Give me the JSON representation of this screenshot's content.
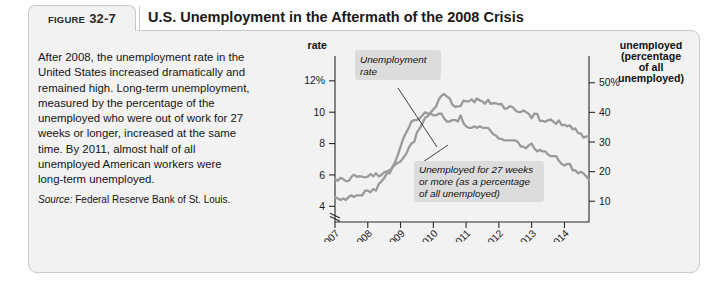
{
  "header": {
    "figure_word": "FIGURE",
    "figure_number": "32-7",
    "title": "U.S. Unemployment in the Aftermath of the 2008 Crisis"
  },
  "caption": {
    "body": "After 2008, the unemployment rate in the United States increased dramatically and remained high. Long-term unemployment, measured by the percentage of the unemployed who were out of work for 27 weeks or longer, increased at the same time. By 2011, almost half of all unemployed American workers were long-term unemployed.",
    "source_label": "Source:",
    "source_text": " Federal Reserve Bank of St. Louis."
  },
  "chart_data": {
    "type": "line",
    "title": "U.S. Unemployment in the Aftermath of the 2008 Crisis",
    "left_axis_title_line1": "Unemployment",
    "left_axis_title_line2": "rate",
    "right_axis_title_line1": "Long-term",
    "right_axis_title_line2": "unemployed",
    "right_axis_title_line3": "(percentage",
    "right_axis_title_line4": "of all",
    "right_axis_title_line5": "unemployed)",
    "xlabel": "Year",
    "grid": false,
    "legend_position": "inline-annotations",
    "axis_break_left": true,
    "xlim": [
      2007.0,
      2014.75
    ],
    "x_tick_labels": [
      "2007",
      "2008",
      "2009",
      "2010",
      "2011",
      "2012",
      "2013",
      "2014"
    ],
    "x_ticks": [
      2007,
      2008,
      2009,
      2010,
      2011,
      2012,
      2013,
      2014
    ],
    "left_ylim": [
      3.0,
      13.2
    ],
    "left_tick_labels": [
      "12%",
      "10",
      "8",
      "6",
      "4"
    ],
    "left_ticks": [
      12,
      10,
      8,
      6,
      4
    ],
    "right_ylim": [
      3.0,
      57.0
    ],
    "right_tick_labels": [
      "50%",
      "40",
      "30",
      "20",
      "10"
    ],
    "right_ticks": [
      50,
      40,
      30,
      20,
      10
    ],
    "annotations": [
      {
        "name": "unemployment-rate-annotation",
        "line1": "Unemployment",
        "line2": "rate"
      },
      {
        "name": "long-term-annotation",
        "line1": "Unemployed for 27 weeks",
        "line2": "or more (as a percentage",
        "line3": "of all unemployed)"
      }
    ],
    "series": [
      {
        "name": "Unemployment rate",
        "axis": "left",
        "unit": "percent",
        "color": "#9a9a9a",
        "x": [
          2007.0,
          2007.08,
          2007.17,
          2007.25,
          2007.33,
          2007.42,
          2007.5,
          2007.58,
          2007.67,
          2007.75,
          2007.83,
          2007.92,
          2008.0,
          2008.08,
          2008.17,
          2008.25,
          2008.33,
          2008.42,
          2008.5,
          2008.58,
          2008.67,
          2008.75,
          2008.83,
          2008.92,
          2009.0,
          2009.08,
          2009.17,
          2009.25,
          2009.33,
          2009.42,
          2009.5,
          2009.58,
          2009.67,
          2009.75,
          2009.83,
          2009.92,
          2010.0,
          2010.08,
          2010.17,
          2010.25,
          2010.33,
          2010.42,
          2010.5,
          2010.58,
          2010.67,
          2010.75,
          2010.83,
          2010.92,
          2011.0,
          2011.08,
          2011.17,
          2011.25,
          2011.33,
          2011.42,
          2011.5,
          2011.58,
          2011.67,
          2011.75,
          2011.83,
          2011.92,
          2012.0,
          2012.08,
          2012.17,
          2012.25,
          2012.33,
          2012.42,
          2012.5,
          2012.58,
          2012.67,
          2012.75,
          2012.83,
          2012.92,
          2013.0,
          2013.08,
          2013.17,
          2013.25,
          2013.33,
          2013.42,
          2013.5,
          2013.58,
          2013.67,
          2013.75,
          2013.83,
          2013.92,
          2014.0,
          2014.08,
          2014.17,
          2014.25,
          2014.33,
          2014.42,
          2014.5,
          2014.58,
          2014.67,
          2014.75
        ],
        "y": [
          4.6,
          4.5,
          4.4,
          4.5,
          4.4,
          4.6,
          4.7,
          4.6,
          4.7,
          4.7,
          4.7,
          5.0,
          5.0,
          4.9,
          5.1,
          5.0,
          5.4,
          5.6,
          5.8,
          6.1,
          6.1,
          6.5,
          6.8,
          7.3,
          7.8,
          8.3,
          8.7,
          9.0,
          9.4,
          9.5,
          9.5,
          9.6,
          9.8,
          10.0,
          9.9,
          9.9,
          9.8,
          9.8,
          9.9,
          9.9,
          9.6,
          9.4,
          9.4,
          9.5,
          9.5,
          9.4,
          9.8,
          9.3,
          9.1,
          9.0,
          9.0,
          9.1,
          9.0,
          9.1,
          9.0,
          9.0,
          9.0,
          8.8,
          8.6,
          8.5,
          8.3,
          8.3,
          8.2,
          8.2,
          8.2,
          8.2,
          8.2,
          8.1,
          7.8,
          7.8,
          7.7,
          7.9,
          8.0,
          7.7,
          7.5,
          7.6,
          7.5,
          7.5,
          7.3,
          7.2,
          7.2,
          7.2,
          6.9,
          6.7,
          6.6,
          6.7,
          6.7,
          6.3,
          6.3,
          6.1,
          6.2,
          6.1,
          5.9,
          5.7
        ]
      },
      {
        "name": "Unemployed for 27 weeks or more (as a percentage of all unemployed)",
        "axis": "right",
        "unit": "percent",
        "color": "#9a9a9a",
        "x": [
          2007.0,
          2007.08,
          2007.17,
          2007.25,
          2007.33,
          2007.42,
          2007.5,
          2007.58,
          2007.67,
          2007.75,
          2007.83,
          2007.92,
          2008.0,
          2008.08,
          2008.17,
          2008.25,
          2008.33,
          2008.42,
          2008.5,
          2008.58,
          2008.67,
          2008.75,
          2008.83,
          2008.92,
          2009.0,
          2009.08,
          2009.17,
          2009.25,
          2009.33,
          2009.42,
          2009.5,
          2009.58,
          2009.67,
          2009.75,
          2009.83,
          2009.92,
          2010.0,
          2010.08,
          2010.17,
          2010.25,
          2010.33,
          2010.42,
          2010.5,
          2010.58,
          2010.67,
          2010.75,
          2010.83,
          2010.92,
          2011.0,
          2011.08,
          2011.17,
          2011.25,
          2011.33,
          2011.42,
          2011.5,
          2011.58,
          2011.67,
          2011.75,
          2011.83,
          2011.92,
          2012.0,
          2012.08,
          2012.17,
          2012.25,
          2012.33,
          2012.42,
          2012.5,
          2012.58,
          2012.67,
          2012.75,
          2012.83,
          2012.92,
          2013.0,
          2013.08,
          2013.17,
          2013.25,
          2013.33,
          2013.42,
          2013.5,
          2013.58,
          2013.67,
          2013.75,
          2013.83,
          2013.92,
          2014.0,
          2014.08,
          2014.17,
          2014.25,
          2014.33,
          2014.42,
          2014.5,
          2014.58,
          2014.67,
          2014.75
        ],
        "y": [
          17.5,
          16.9,
          17.9,
          17.5,
          16.8,
          16.9,
          18.2,
          19.0,
          18.2,
          18.5,
          18.3,
          18.1,
          18.3,
          19.2,
          18.4,
          19.5,
          18.4,
          18.9,
          19.8,
          20.0,
          20.5,
          21.3,
          22.3,
          23.0,
          23.4,
          24.6,
          26.0,
          28.0,
          29.5,
          30.1,
          33.3,
          34.5,
          36.3,
          38.2,
          38.7,
          40.0,
          41.0,
          41.9,
          44.5,
          45.6,
          46.2,
          45.3,
          44.7,
          42.6,
          41.9,
          42.0,
          42.1,
          44.0,
          43.7,
          43.7,
          44.4,
          43.4,
          44.7,
          44.0,
          43.7,
          42.9,
          44.3,
          42.9,
          43.1,
          43.0,
          42.7,
          42.9,
          41.3,
          41.3,
          42.1,
          41.8,
          40.7,
          40.2,
          40.1,
          40.6,
          40.1,
          39.4,
          38.0,
          39.6,
          39.5,
          37.1,
          37.1,
          36.8,
          37.3,
          37.6,
          36.8,
          36.1,
          37.3,
          35.7,
          35.8,
          35.3,
          35.6,
          34.3,
          34.6,
          33.0,
          32.9,
          31.5,
          31.9,
          31.9
        ]
      }
    ]
  }
}
